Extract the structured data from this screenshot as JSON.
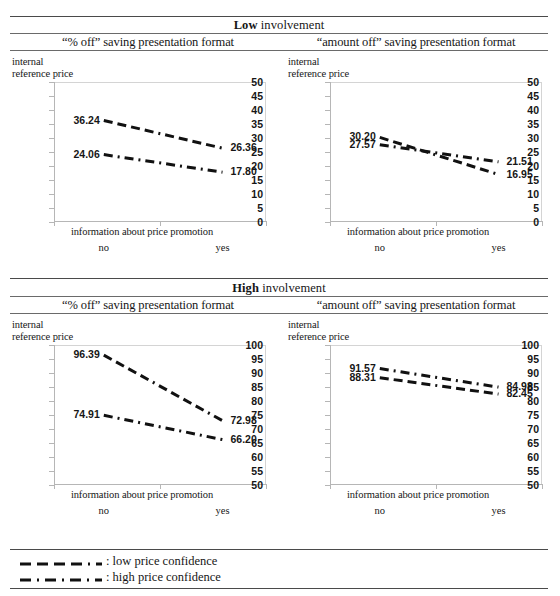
{
  "figure": {
    "bands": [
      {
        "title_bold": "Low",
        "title_rest": " involvement"
      },
      {
        "title_bold": "High",
        "title_rest": " involvement"
      }
    ],
    "column_headers": [
      "“% off” saving presentation format",
      "“amount off” saving presentation format"
    ],
    "y_axis_title_line1": "internal",
    "y_axis_title_line2": "reference price",
    "x_axis_title": "information about price promotion",
    "x_categories": [
      "no",
      "yes"
    ],
    "legend": [
      {
        "style": "dashed",
        "label": ": low price confidence"
      },
      {
        "style": "dashdot",
        "label": ": high price confidence"
      }
    ]
  },
  "chart_data": [
    {
      "id": "low-percent-off",
      "type": "line",
      "title": "Low involvement — “% off” saving presentation format",
      "xlabel": "information about price promotion",
      "ylabel": "internal reference price",
      "categories": [
        "no",
        "yes"
      ],
      "ylim": [
        0,
        50
      ],
      "yticks": [
        0,
        5,
        10,
        15,
        20,
        25,
        30,
        35,
        40,
        45,
        50
      ],
      "grid": false,
      "legend_position": "figure-bottom",
      "series": [
        {
          "name": "low price confidence",
          "style": "dashed",
          "values": [
            36.24,
            26.36
          ],
          "labels": [
            "36.24",
            "26.36"
          ]
        },
        {
          "name": "high price confidence",
          "style": "dashdot",
          "values": [
            24.06,
            17.8
          ],
          "labels": [
            "24.06",
            "17.80"
          ]
        }
      ]
    },
    {
      "id": "low-amount-off",
      "type": "line",
      "title": "Low involvement — “amount off” saving presentation format",
      "xlabel": "information about price promotion",
      "ylabel": "internal reference price",
      "categories": [
        "no",
        "yes"
      ],
      "ylim": [
        0,
        50
      ],
      "yticks": [
        0,
        5,
        10,
        15,
        20,
        25,
        30,
        35,
        40,
        45,
        50
      ],
      "grid": false,
      "legend_position": "figure-bottom",
      "series": [
        {
          "name": "low price confidence",
          "style": "dashed",
          "values": [
            30.2,
            16.95
          ],
          "labels": [
            "30.20",
            "16.95"
          ]
        },
        {
          "name": "high price confidence",
          "style": "dashdot",
          "values": [
            27.57,
            21.51
          ],
          "labels": [
            "27.57",
            "21.51"
          ]
        }
      ]
    },
    {
      "id": "high-percent-off",
      "type": "line",
      "title": "High involvement — “% off” saving presentation format",
      "xlabel": "information about price promotion",
      "ylabel": "internal reference price",
      "categories": [
        "no",
        "yes"
      ],
      "ylim": [
        50,
        100
      ],
      "yticks": [
        50,
        55,
        60,
        65,
        70,
        75,
        80,
        85,
        90,
        95,
        100
      ],
      "grid": false,
      "legend_position": "figure-bottom",
      "series": [
        {
          "name": "low price confidence",
          "style": "dashed",
          "values": [
            96.39,
            72.98
          ],
          "labels": [
            "96.39",
            "72.98"
          ]
        },
        {
          "name": "high price confidence",
          "style": "dashdot",
          "values": [
            74.91,
            66.2
          ],
          "labels": [
            "74.91",
            "66.20"
          ]
        }
      ]
    },
    {
      "id": "high-amount-off",
      "type": "line",
      "title": "High involvement — “amount off” saving presentation format",
      "xlabel": "information about price promotion",
      "ylabel": "internal reference price",
      "categories": [
        "no",
        "yes"
      ],
      "ylim": [
        50,
        100
      ],
      "yticks": [
        50,
        55,
        60,
        65,
        70,
        75,
        80,
        85,
        90,
        95,
        100
      ],
      "grid": false,
      "legend_position": "figure-bottom",
      "series": [
        {
          "name": "low price confidence",
          "style": "dashed",
          "values": [
            88.31,
            82.45
          ],
          "labels": [
            "88.31",
            "82.45"
          ]
        },
        {
          "name": "high price confidence",
          "style": "dashdot",
          "values": [
            91.57,
            84.98
          ],
          "labels": [
            "91.57",
            "84.98"
          ]
        }
      ]
    }
  ]
}
